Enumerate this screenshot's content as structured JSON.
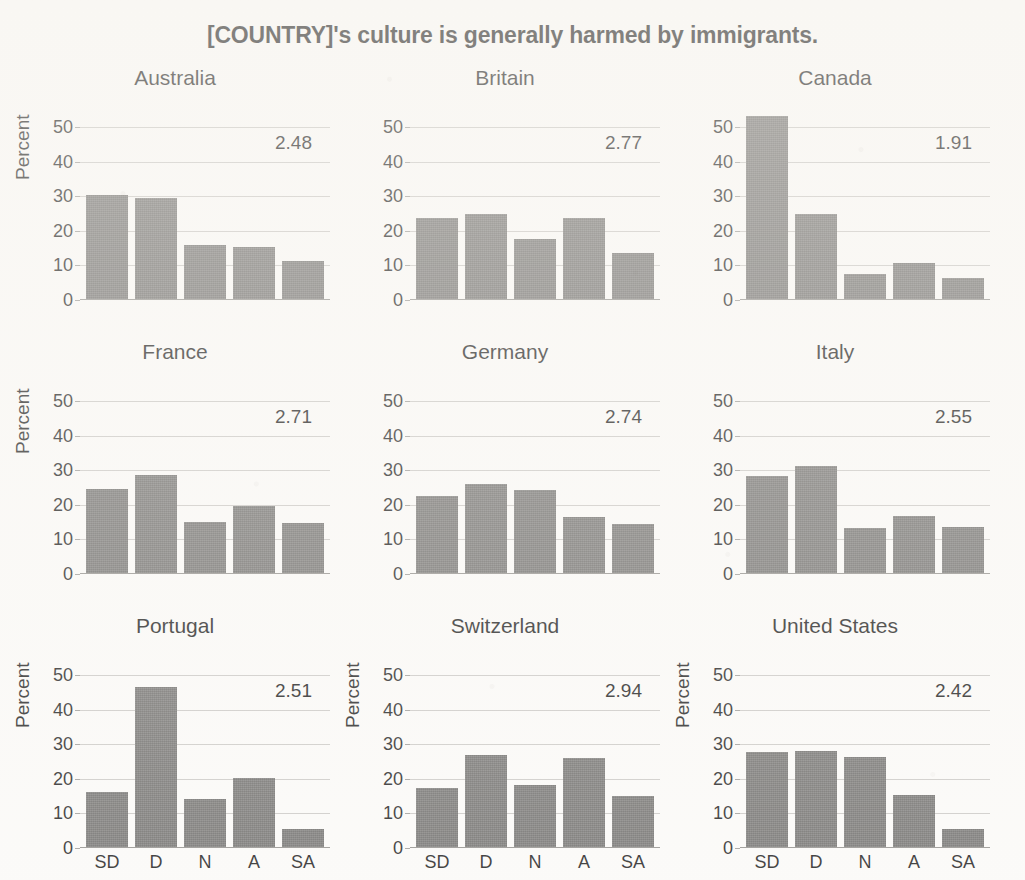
{
  "chart_data": {
    "type": "bar",
    "title": "[COUNTRY]'s culture is generally harmed by immigrants.",
    "xlabel": "",
    "ylabel": "Percent",
    "categories": [
      "SD",
      "D",
      "N",
      "A",
      "SA"
    ],
    "yticks": [
      0,
      10,
      20,
      30,
      40,
      50
    ],
    "ylim": [
      0,
      55
    ],
    "grid": true,
    "legend": "none",
    "layout": "3 x 3 small-multiples grid",
    "annotation_note": "Each panel shows the country mean score printed in the upper right.",
    "panels": [
      {
        "country": "Australia",
        "mean": "2.48",
        "ylabel": "Percent",
        "show_xticks": false,
        "values": [
          30.0,
          29.2,
          15.6,
          15.2,
          11.0
        ]
      },
      {
        "country": "Britain",
        "mean": "2.77",
        "ylabel": "",
        "show_xticks": false,
        "values": [
          23.5,
          24.6,
          17.5,
          23.4,
          13.2
        ]
      },
      {
        "country": "Canada",
        "mean": "1.91",
        "ylabel": "",
        "show_xticks": false,
        "values": [
          53.0,
          24.6,
          7.3,
          10.5,
          6.0
        ]
      },
      {
        "country": "France",
        "mean": "2.71",
        "ylabel": "Percent",
        "show_xticks": false,
        "values": [
          24.2,
          28.4,
          14.8,
          19.3,
          14.6
        ]
      },
      {
        "country": "Germany",
        "mean": "2.74",
        "ylabel": "",
        "show_xticks": false,
        "values": [
          22.3,
          25.9,
          24.0,
          16.3,
          14.2
        ]
      },
      {
        "country": "Italy",
        "mean": "2.55",
        "ylabel": "",
        "show_xticks": false,
        "values": [
          28.0,
          31.0,
          13.1,
          16.4,
          13.3
        ]
      },
      {
        "country": "Portugal",
        "mean": "2.51",
        "ylabel": "Percent",
        "show_xticks": true,
        "values": [
          16.0,
          46.2,
          14.0,
          19.9,
          5.2
        ]
      },
      {
        "country": "Switzerland",
        "mean": "2.94",
        "ylabel": "Percent",
        "show_xticks": true,
        "values": [
          17.1,
          26.5,
          17.9,
          25.9,
          14.8
        ]
      },
      {
        "country": "United States",
        "mean": "2.42",
        "ylabel": "Percent",
        "show_xticks": true,
        "values": [
          27.6,
          27.9,
          26.1,
          15.0,
          5.1
        ]
      }
    ],
    "colors": {
      "bar": "#6e6d6b",
      "grid": "#c9c7c4",
      "axis": "#8e8c89",
      "text": "#151515",
      "background": "#fbfaf8"
    }
  }
}
